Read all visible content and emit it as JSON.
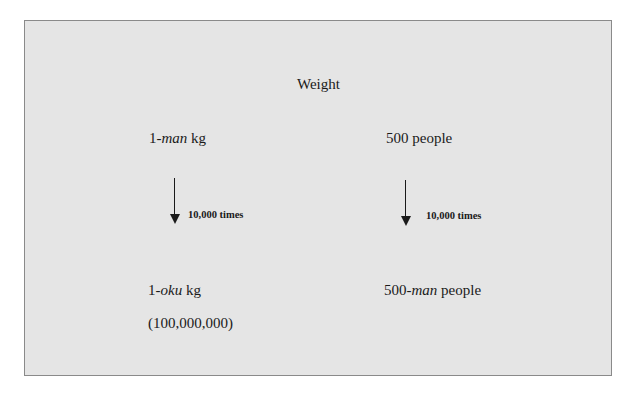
{
  "diagram": {
    "title": "Weight",
    "left_column": {
      "top": {
        "prefix": "1-",
        "italic": "man",
        "suffix": " kg"
      },
      "arrow_label": "10,000 times",
      "bottom": {
        "prefix": "1-",
        "italic": "oku",
        "suffix": " kg"
      },
      "note": "(100,000,000)"
    },
    "right_column": {
      "top": {
        "prefix": "500 people",
        "italic": "",
        "suffix": ""
      },
      "arrow_label": "10,000 times",
      "bottom": {
        "prefix": "500-",
        "italic": "man",
        "suffix": " people"
      }
    },
    "colors": {
      "panel_background": "#e5e5e5",
      "panel_border": "#8a8a8a",
      "text": "#1a1a1a"
    }
  }
}
